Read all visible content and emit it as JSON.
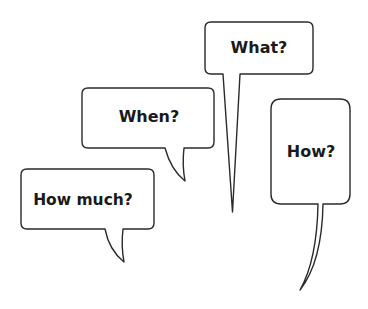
{
  "diagram": {
    "title": "",
    "background": "#ffffff",
    "stroke_color": "#2a2a2a",
    "text_color": "#1a1a1a",
    "bubbles": [
      {
        "id": "what",
        "label": "What?",
        "shape": "rounded-rect",
        "tail": "long-straight-spike-down"
      },
      {
        "id": "when",
        "label": "When?",
        "shape": "rounded-rect",
        "tail": "short-curved-down-right"
      },
      {
        "id": "how-much",
        "label": "How much?",
        "shape": "rounded-rect",
        "tail": "short-curved-down-right"
      },
      {
        "id": "how",
        "label": "How?",
        "shape": "tall-rounded-rect",
        "tail": "long-curved-down-left"
      }
    ]
  }
}
